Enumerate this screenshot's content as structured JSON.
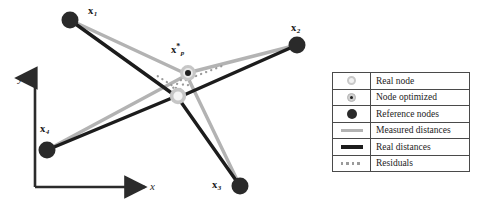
{
  "figure": {
    "background": "#ffffff"
  },
  "axes": {
    "x_label": "x",
    "y_label": "y",
    "origin": [
      35,
      187
    ],
    "x_arrow_end": [
      152,
      187
    ],
    "y_arrow_end": [
      35,
      71
    ]
  },
  "colors": {
    "reference_node": "#2a2a2a",
    "real_node_ring": "#c9c9c9",
    "real_node_fill": "#f2f2f2",
    "optimized_node_ring": "#cfcfcf",
    "optimized_node_dot": "#1e1e1e",
    "measured_line": "#b3b3b3",
    "real_line": "#1c1c1c",
    "residual_line": "#9a9a9a",
    "legend_border": "#4a4a4a",
    "text": "#1a1a1a"
  },
  "nodes": {
    "reference": [
      {
        "id": "x1",
        "label_base": "x",
        "label_sub": "1",
        "cx": 70,
        "cy": 20,
        "r": 8.5,
        "label_x": 88,
        "label_y": 8
      },
      {
        "id": "x2",
        "label_base": "x",
        "label_sub": "2",
        "cx": 297,
        "cy": 45,
        "r": 8.5,
        "label_x": 291,
        "label_y": 25
      },
      {
        "id": "x3",
        "label_base": "x",
        "label_sub": "3",
        "cx": 240,
        "cy": 186,
        "r": 8.5,
        "label_x": 214,
        "label_y": 182
      },
      {
        "id": "x4",
        "label_base": "x",
        "label_sub": "4",
        "cx": 47,
        "cy": 150,
        "r": 8.5,
        "label_x": 42,
        "label_y": 126
      }
    ],
    "optimized": {
      "id": "xp_star",
      "label_base": "x",
      "label_sup": "*",
      "label_sub": "p",
      "cx": 188,
      "cy": 73,
      "ring_r": 6.5,
      "dot_r": 2.8,
      "label_x": 172,
      "label_y": 44
    },
    "real": {
      "id": "xp_real",
      "cx": 178,
      "cy": 96,
      "ring_r": 6.5
    }
  },
  "edges": {
    "measured_distances": [
      {
        "from": "x1",
        "to": "xp_star"
      },
      {
        "from": "x2",
        "to": "xp_star"
      },
      {
        "from": "x3",
        "to": "xp_star"
      },
      {
        "from": "x4",
        "to": "xp_star"
      }
    ],
    "real_distances": [
      {
        "from": "x1",
        "to": "xp_real"
      },
      {
        "from": "x2",
        "to": "xp_real"
      },
      {
        "from": "x3",
        "to": "xp_real"
      },
      {
        "from": "x4",
        "to": "xp_real"
      }
    ],
    "residuals": [
      {
        "from": "xp_star",
        "to": "xp_real",
        "note": "dotted short links between optimized and real node"
      }
    ]
  },
  "legend": {
    "rows": [
      {
        "key": "real-node-swatch",
        "label": "Real node"
      },
      {
        "key": "optimized-node-swatch",
        "label": "Node optimized"
      },
      {
        "key": "reference-node-swatch",
        "label": "Reference nodes"
      },
      {
        "key": "measured-line-swatch",
        "label": "Measured distances"
      },
      {
        "key": "real-line-swatch",
        "label": "Real distances"
      },
      {
        "key": "residual-line-swatch",
        "label": "Residuals"
      }
    ]
  }
}
